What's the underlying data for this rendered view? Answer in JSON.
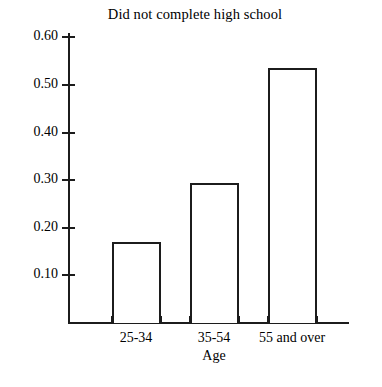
{
  "chart_data": {
    "type": "bar",
    "title": "Did not complete high school",
    "xlabel": "Age",
    "ylabel": "",
    "categories": [
      "25-34",
      "35-54",
      "55 and over"
    ],
    "values": [
      0.17,
      0.295,
      0.535
    ],
    "ylim": [
      0.0,
      0.63
    ],
    "yticks": [
      0.1,
      0.2,
      0.3,
      0.4,
      0.5,
      0.6
    ],
    "ytick_labels": [
      "0.10",
      "0.20",
      "0.30",
      "0.40",
      "0.50",
      "0.60"
    ],
    "grid": false,
    "legend": null,
    "bar_style": {
      "fill": "#ffffff",
      "edge_color": "#1c1c1c"
    }
  }
}
